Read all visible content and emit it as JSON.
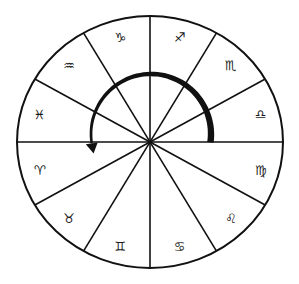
{
  "diagram": {
    "type": "zodiac-wheel",
    "center": [
      150,
      142
    ],
    "radius_x": 133,
    "radius_y": 126,
    "sector_count": 12,
    "sector_angle_deg": 30,
    "stroke_color": "#111111",
    "background_color": "#ffffff",
    "signs": [
      {
        "name": "Libra",
        "glyph": "♎",
        "mid_angle_deg": 15
      },
      {
        "name": "Scorpio",
        "glyph": "♏",
        "mid_angle_deg": 45
      },
      {
        "name": "Sagittarius",
        "glyph": "♐",
        "mid_angle_deg": 75
      },
      {
        "name": "Capricorn",
        "glyph": "♑",
        "mid_angle_deg": 105
      },
      {
        "name": "Aquarius",
        "glyph": "♒",
        "mid_angle_deg": 135
      },
      {
        "name": "Pisces",
        "glyph": "♓",
        "mid_angle_deg": 165
      },
      {
        "name": "Aries",
        "glyph": "♈",
        "mid_angle_deg": 195
      },
      {
        "name": "Taurus",
        "glyph": "♉",
        "mid_angle_deg": 225
      },
      {
        "name": "Gemini",
        "glyph": "♊",
        "mid_angle_deg": 255
      },
      {
        "name": "Cancer",
        "glyph": "♋",
        "mid_angle_deg": 285
      },
      {
        "name": "Leo",
        "glyph": "♌",
        "mid_angle_deg": 315
      },
      {
        "name": "Virgo",
        "glyph": "♍",
        "mid_angle_deg": 345
      }
    ],
    "arrow": {
      "direction": "counter-clockwise",
      "description": "Thick curved arrow sweeping from Libra/Virgo boundary over the top to Pisces/Aries",
      "start_angle_deg": -8,
      "end_angle_deg": 197,
      "radius": 60,
      "color": "#111111"
    }
  }
}
